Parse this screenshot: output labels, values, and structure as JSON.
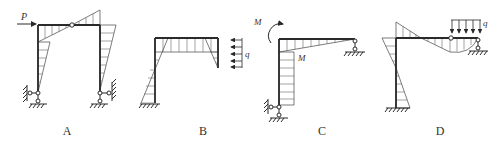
{
  "figure": {
    "colors": {
      "line": "#2a2a2a",
      "hatch": "#555555",
      "background": "#ffffff"
    },
    "panels": [
      {
        "id": "A",
        "label": "A",
        "load_label": "P",
        "load_type": "horizontal point force"
      },
      {
        "id": "B",
        "label": "B",
        "load_label": "q",
        "load_type": "uniform distributed load (horizontal)"
      },
      {
        "id": "C",
        "label": "C",
        "load_label": "M",
        "moment_label": "M",
        "load_type": "applied couple"
      },
      {
        "id": "D",
        "label": "D",
        "load_label": "q",
        "load_type": "uniform distributed load (vertical)"
      }
    ]
  }
}
